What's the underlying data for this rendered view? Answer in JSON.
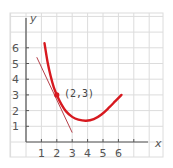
{
  "chart_data": {
    "type": "line",
    "title": "",
    "xlabel": "x",
    "ylabel": "y",
    "xlim": [
      -1,
      8.8
    ],
    "ylim": [
      -1,
      8.1
    ],
    "grid": true,
    "x_ticks": [
      1,
      2,
      3,
      4,
      5,
      6
    ],
    "y_ticks": [
      1,
      2,
      3,
      4,
      5,
      6
    ],
    "series": [
      {
        "name": "curve",
        "color": "#d7191f",
        "x": [
          1.2,
          1.4,
          1.6,
          1.8,
          2.0,
          2.3,
          2.6,
          3.0,
          3.4,
          3.9,
          4.4,
          4.9,
          5.4,
          5.8,
          6.2
        ],
        "y": [
          6.3,
          5.1,
          4.2,
          3.5,
          3.0,
          2.4,
          1.95,
          1.6,
          1.42,
          1.35,
          1.45,
          1.75,
          2.2,
          2.6,
          3.0
        ]
      },
      {
        "name": "tangent line",
        "color": "#b5404a",
        "x": [
          0.7,
          3.0
        ],
        "y": [
          5.4,
          0.6
        ]
      }
    ],
    "annotations": [
      {
        "text": "(2,3)",
        "x": 2,
        "y": 3,
        "marker": true
      }
    ]
  },
  "labels": {
    "x_axis": "x",
    "y_axis": "y",
    "x_ticks": [
      "1",
      "2",
      "3",
      "4",
      "5",
      "6"
    ],
    "y_ticks": [
      "1",
      "2",
      "3",
      "4",
      "5",
      "6"
    ],
    "point": "(2,3)"
  },
  "colors": {
    "grid": "#dcdcdc",
    "axis": "#555555",
    "curve": "#d7191f",
    "tangent": "#b5404a"
  }
}
